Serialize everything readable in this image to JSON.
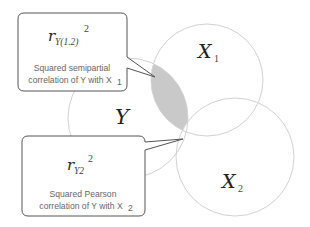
{
  "diagram": {
    "type": "venn",
    "colors": {
      "circle_stroke": "#cfcfcf",
      "shaded_region": "#c9c9c9",
      "box_stroke": "#555555",
      "caption_text": "#666666",
      "label_text": "#222222"
    },
    "circles": [
      {
        "id": "Y",
        "label": "Y",
        "subscript": "",
        "cx": 128,
        "cy": 118,
        "r": 60
      },
      {
        "id": "X1",
        "label": "X",
        "subscript": "1",
        "cx": 207,
        "cy": 80,
        "r": 56
      },
      {
        "id": "X2",
        "label": "X",
        "subscript": "2",
        "cx": 235,
        "cy": 157,
        "r": 59
      }
    ],
    "callouts": [
      {
        "id": "semipartial",
        "formula_base": "r",
        "formula_sub": "Y(1.2)",
        "formula_sup": "2",
        "caption_line1": "Squared semipartial",
        "caption_line2": "correlation of Y with X",
        "caption_sub": "1"
      },
      {
        "id": "pearson",
        "formula_base": "r",
        "formula_sub": "Y2",
        "formula_sup": "2",
        "caption_line1": "Squared Pearson",
        "caption_line2": "correlation of Y with X",
        "caption_sub": "2"
      }
    ]
  }
}
